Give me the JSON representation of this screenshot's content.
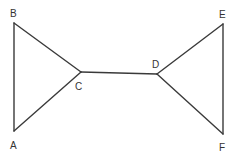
{
  "diagram": {
    "type": "graph",
    "line_color": "#3a3a3a",
    "label_color": "#333333",
    "nodes": [
      {
        "id": "A",
        "label": "A",
        "x": 14,
        "y": 131,
        "lx": 10,
        "ly": 149
      },
      {
        "id": "B",
        "label": "B",
        "x": 14,
        "y": 23,
        "lx": 10,
        "ly": 17
      },
      {
        "id": "C",
        "label": "C",
        "x": 81,
        "y": 72,
        "lx": 75,
        "ly": 90
      },
      {
        "id": "D",
        "label": "D",
        "x": 157,
        "y": 74,
        "lx": 152,
        "ly": 68
      },
      {
        "id": "E",
        "label": "E",
        "x": 223,
        "y": 24,
        "lx": 219,
        "ly": 18
      },
      {
        "id": "F",
        "label": "F",
        "x": 223,
        "y": 134,
        "lx": 219,
        "ly": 151
      }
    ],
    "edges": [
      {
        "from": "A",
        "to": "B"
      },
      {
        "from": "B",
        "to": "C"
      },
      {
        "from": "C",
        "to": "A"
      },
      {
        "from": "C",
        "to": "D"
      },
      {
        "from": "D",
        "to": "E"
      },
      {
        "from": "E",
        "to": "F"
      },
      {
        "from": "F",
        "to": "D"
      }
    ]
  }
}
